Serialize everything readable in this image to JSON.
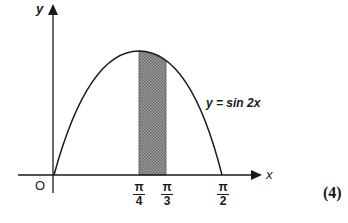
{
  "diagram": {
    "axes": {
      "x_label": "x",
      "y_label": "y",
      "origin_label": "O"
    },
    "curve_label": "y = sin 2x",
    "x_ticks": [
      {
        "num": "π",
        "den": "4"
      },
      {
        "num": "π",
        "den": "3"
      },
      {
        "num": "π",
        "den": "2"
      }
    ],
    "shaded_region": {
      "from": "π/4",
      "to": "π/3"
    },
    "question_marks": "(4)"
  },
  "colors": {
    "line": "#1a1a1a",
    "shade": "#8a8a8a"
  }
}
